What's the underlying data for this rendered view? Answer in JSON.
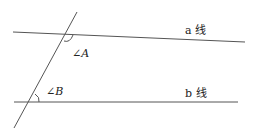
{
  "diagram": {
    "type": "parallel-lines-transversal",
    "line_a_label": "a 线",
    "line_b_label": "b 线",
    "angle_a_label": "∠A",
    "angle_b_label": "∠B",
    "line_color": "#555555"
  }
}
